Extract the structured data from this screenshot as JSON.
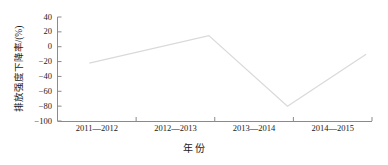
{
  "chart_data": {
    "type": "line",
    "title": "",
    "xlabel": "年 份",
    "ylabel": "排放强度下降率/(%)",
    "categories": [
      "2011—2012",
      "2012—2013",
      "2013—2014",
      "2014—2015"
    ],
    "values": [
      -22,
      15,
      -80,
      -10
    ],
    "series": [
      {
        "name": "排放强度下降率",
        "values": [
          -22,
          15,
          -80,
          -10
        ]
      }
    ],
    "ylim": [
      -100,
      40
    ],
    "ytick_labels": [
      "40",
      "20",
      "0",
      "−20",
      "−40",
      "−60",
      "−80",
      "−100"
    ],
    "ytick_values": [
      40,
      20,
      0,
      -20,
      -40,
      -60,
      -80,
      -100
    ],
    "grid": false,
    "legend": false,
    "line_color": "#d9d9d9",
    "axis_color": "#8a8a8a",
    "text_color": "#1a1a1a"
  }
}
